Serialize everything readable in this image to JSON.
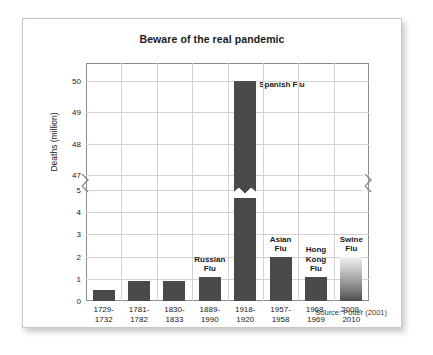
{
  "card": {
    "source_note": "Source: Potter (2001)"
  },
  "chart_data": {
    "type": "bar",
    "title": "Beware of the real pandemic",
    "xlabel": "",
    "ylabel": "Deaths (million)",
    "grid": true,
    "legend": false,
    "axis_break": {
      "present": true,
      "lower_max": 5,
      "upper_min": 47
    },
    "ylim": [
      0,
      50
    ],
    "yticks": [
      0,
      1,
      2,
      3,
      4,
      5,
      47,
      48,
      49,
      50
    ],
    "ytick_labels": [
      "0",
      "1",
      "2",
      "3",
      "4",
      "5",
      "47",
      "48",
      "49",
      "50"
    ],
    "categories": [
      "1729-\n1732",
      "1781-\n1782",
      "1830-\n1833",
      "1889-\n1990",
      "1918-\n1920",
      "1957-\n1958",
      "1968-\n1969",
      "2009-\n2010"
    ],
    "values": [
      0.5,
      0.9,
      0.9,
      1.1,
      50,
      2.0,
      1.1,
      2.0
    ],
    "annotations": [
      {
        "category": "1889-\n1990",
        "text": "Russian\nFlu"
      },
      {
        "category": "1918-\n1920",
        "text": "Spanish Flu"
      },
      {
        "category": "1957-\n1958",
        "text": "Asian\nFlu"
      },
      {
        "category": "1968-\n1969",
        "text": "Hong\nKong\nFlu"
      },
      {
        "category": "2009-\n2010",
        "text": "Swine\nFlu"
      }
    ],
    "colors": {
      "bar": "#4a4a4a",
      "gradient_bar": "#9d9d9d",
      "grid": "#d2d2d2",
      "axis": "#8d8d8d",
      "text": "#1a1a1a"
    }
  }
}
